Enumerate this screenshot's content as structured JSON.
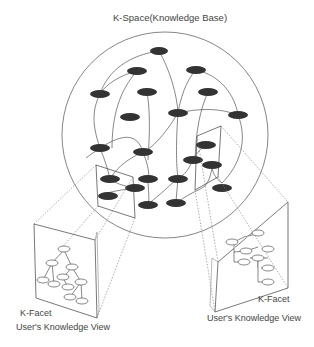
{
  "title": "K-Space(Knowledge Base)",
  "left_facet": {
    "facet_label": "K-Facet",
    "view_label": "User's Knowledge View"
  },
  "right_facet": {
    "facet_label": "K-Facet",
    "view_label": "User's Knowledge View"
  },
  "colors": {
    "node_fill": "#333333",
    "line": "#555555",
    "text": "#444444",
    "background": "#ffffff"
  }
}
